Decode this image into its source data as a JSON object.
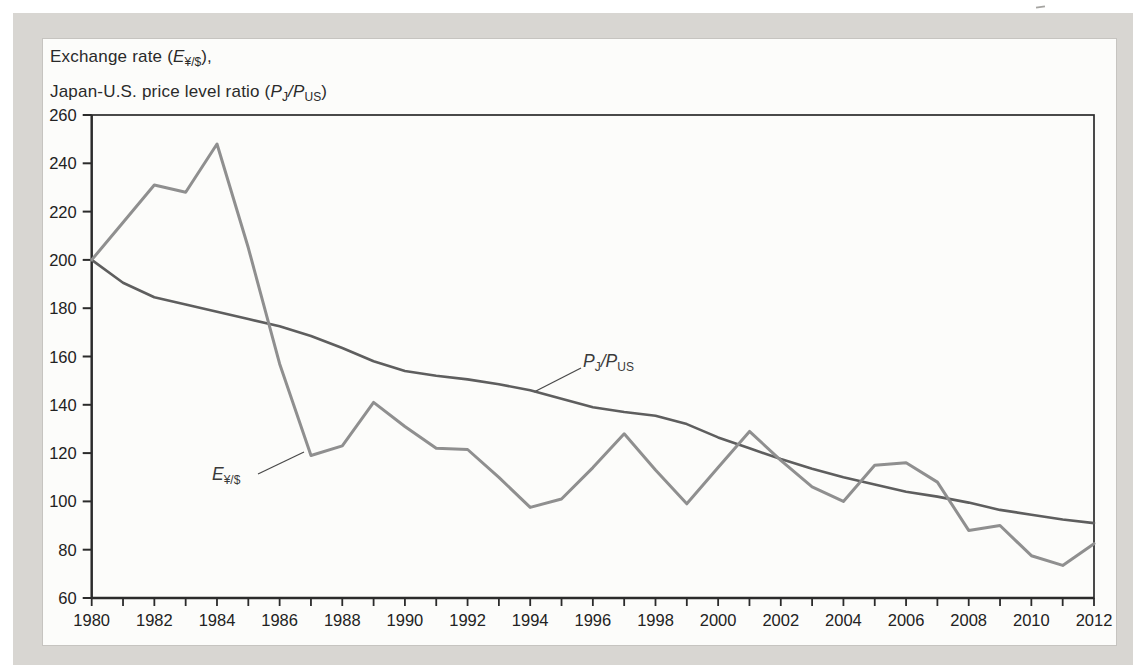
{
  "header": {
    "l1_pre": "Exchange rate (",
    "l1_var": "E",
    "l1_sub": "¥/$",
    "l1_post": "),",
    "l2_pre": "Japan-U.S. price level ratio (",
    "l2_var1": "P",
    "l2_sub1": "J",
    "l2_sep": "/",
    "l2_var2": "P",
    "l2_sub2": "US",
    "l2_post": ")"
  },
  "labels": {
    "e_var": "E",
    "e_sub": "¥/$",
    "p_var1": "P",
    "p_sub1": "J",
    "p_sep": "/",
    "p_var2": "P",
    "p_sub2": "US"
  },
  "colors": {
    "panel_bg": "#d8d6d2",
    "chart_bg": "#fcfcfa",
    "axis": "#2b2b2b",
    "tick_text": "#222222",
    "exchange_line": "#8f8f8f",
    "price_line": "#5e5e5e"
  },
  "chart_data": {
    "type": "line",
    "title": "Exchange rate (E¥/$), Japan-U.S. price level ratio (PJ/PUS)",
    "xlabel": "",
    "ylabel": "",
    "xlim": [
      1980,
      2012
    ],
    "ylim": [
      60,
      260
    ],
    "grid": false,
    "legend_position": "inline-annotations",
    "x": [
      1980,
      1981,
      1982,
      1983,
      1984,
      1985,
      1986,
      1987,
      1988,
      1989,
      1990,
      1991,
      1992,
      1993,
      1994,
      1995,
      1996,
      1997,
      1998,
      1999,
      2000,
      2001,
      2002,
      2003,
      2004,
      2005,
      2006,
      2007,
      2008,
      2009,
      2010,
      2011,
      2012
    ],
    "yticks": [
      60,
      80,
      100,
      120,
      140,
      160,
      180,
      200,
      220,
      240,
      260
    ],
    "xtick_labels": [
      1980,
      1982,
      1984,
      1986,
      1988,
      1990,
      1992,
      1994,
      1996,
      1998,
      2000,
      2002,
      2004,
      2006,
      2008,
      2010,
      2012
    ],
    "series": [
      {
        "name": "P_J/P_US (Japan-U.S. price level ratio)",
        "color": "#5e5e5e",
        "width": 2.6,
        "values": [
          200,
          190.5,
          184.5,
          181.5,
          178.5,
          175.5,
          172.5,
          168.5,
          163.5,
          158,
          154,
          152,
          150.5,
          148.5,
          146,
          142.5,
          139,
          137,
          135.5,
          132,
          126.5,
          122,
          117.5,
          113.5,
          110,
          107,
          104,
          102,
          99.5,
          96.5,
          94.5,
          92.5,
          91
        ]
      },
      {
        "name": "E_¥/$ (yen/dollar exchange rate)",
        "color": "#8f8f8f",
        "width": 3,
        "values": [
          200,
          215.5,
          231,
          228,
          248,
          205,
          157,
          119,
          123,
          141,
          131,
          122,
          121.5,
          110,
          97.5,
          101,
          114,
          128,
          113,
          99,
          114,
          129,
          117,
          106,
          100,
          115,
          116,
          108,
          88,
          90,
          77.5,
          73.5,
          82.5
        ]
      }
    ]
  }
}
